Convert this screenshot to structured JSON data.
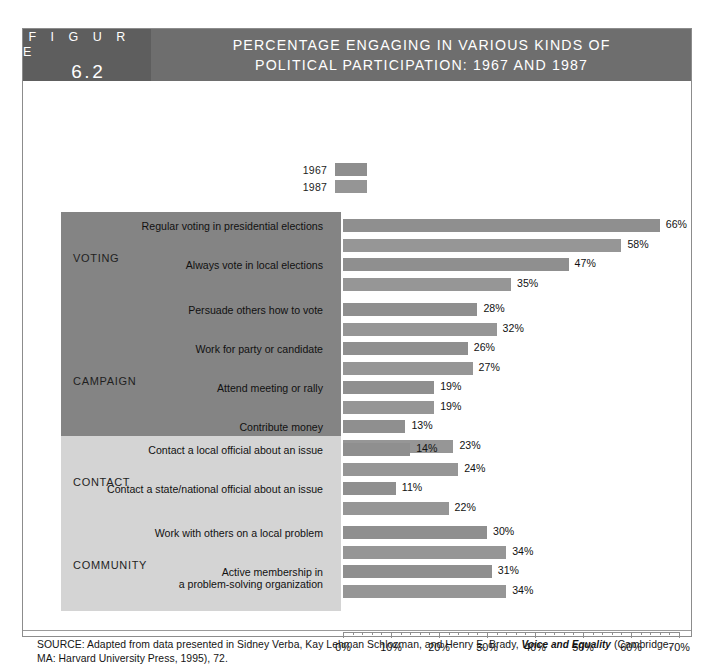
{
  "figure": {
    "badge_word": "F I G U R E",
    "badge_number": "6.2",
    "title_line_1": "PERCENTAGE ENGAGING IN VARIOUS KINDS OF",
    "title_line_2": "POLITICAL PARTICIPATION: 1967 AND 1987"
  },
  "legend": {
    "items": [
      {
        "label": "1967",
        "color": "#8e8e8e"
      },
      {
        "label": "1987",
        "color": "#959595"
      }
    ]
  },
  "axis": {
    "labels": [
      "0%",
      "10%",
      "20%",
      "30%",
      "40%",
      "50%",
      "60%",
      "70%"
    ],
    "min": 0,
    "max": 70,
    "minor_step": 2
  },
  "source": {
    "prefix": "SOURCE: Adapted from data presented in Sidney Verba, Kay Lehman Schlozman, and Henry E. Brady, ",
    "italic": "Voice and Equality",
    "suffix": " (Cambridge, MA: Harvard University Press, 1995), 72."
  },
  "chart_data": {
    "type": "bar",
    "orientation": "horizontal",
    "title": "PERCENTAGE ENGAGING IN VARIOUS KINDS OF POLITICAL PARTICIPATION: 1967 AND 1987",
    "xlabel": "",
    "ylabel": "",
    "xlim": [
      0,
      70
    ],
    "xtick_labels": [
      "0%",
      "10%",
      "20%",
      "30%",
      "40%",
      "50%",
      "60%",
      "70%"
    ],
    "grid": false,
    "legend": [
      "1967",
      "1987"
    ],
    "legend_position": "top-center",
    "value_suffix": "%",
    "groups": [
      {
        "name": "VOTING",
        "panel_shade": "dark",
        "categories": [
          {
            "label": "Regular voting in presidential elections",
            "values": {
              "1967": 66,
              "1987": 58
            }
          },
          {
            "label": "Always vote in local elections",
            "values": {
              "1967": 47,
              "1987": 35
            }
          }
        ]
      },
      {
        "name": "CAMPAIGN",
        "panel_shade": "dark",
        "categories": [
          {
            "label": "Persuade others how to vote",
            "values": {
              "1967": 28,
              "1987": 32
            }
          },
          {
            "label": "Work for party or candidate",
            "values": {
              "1967": 26,
              "1987": 27
            }
          },
          {
            "label": "Attend meeting or rally",
            "values": {
              "1967": 19,
              "1987": 19
            }
          },
          {
            "label": "Contribute money",
            "values": {
              "1967": 13,
              "1987": 23
            }
          }
        ]
      },
      {
        "name": "CONTACT",
        "panel_shade": "light",
        "categories": [
          {
            "label": "Contact a local official about an issue",
            "values": {
              "1967": 14,
              "1987": 24
            }
          },
          {
            "label": "Contact a state/national official about an issue",
            "values": {
              "1967": 11,
              "1987": 22
            }
          }
        ]
      },
      {
        "name": "COMMUNITY",
        "panel_shade": "light",
        "categories": [
          {
            "label": "Work with others on a local problem",
            "values": {
              "1967": 30,
              "1987": 34
            }
          },
          {
            "label": "Active membership in\na problem-solving organization",
            "values": {
              "1967": 31,
              "1987": 34
            }
          }
        ]
      }
    ]
  }
}
